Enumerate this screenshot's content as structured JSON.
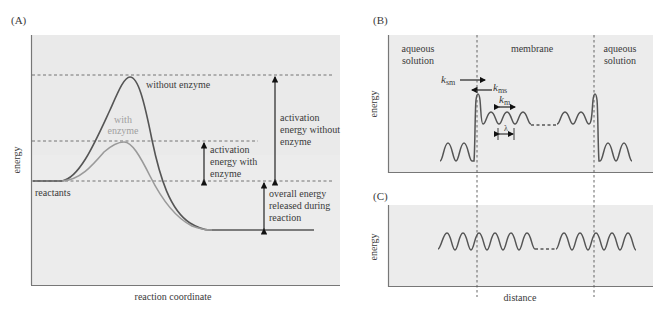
{
  "panelA": {
    "label": "(A)",
    "ylabel": "energy",
    "xlabel": "reaction coordinate",
    "curve_without": "without enzyme",
    "curve_with_1": "with",
    "curve_with_2": "enzyme",
    "reactants": "reactants",
    "act_without_1": "activation",
    "act_without_2": "energy without",
    "act_without_3": "enzyme",
    "act_with_1": "activation",
    "act_with_2": "energy with",
    "act_with_3": "enzyme",
    "overall_1": "overall energy",
    "overall_2": "released during",
    "overall_3": "reaction",
    "colors": {
      "without": "#555555",
      "with": "#9a9a9a",
      "bg": "#ececec"
    }
  },
  "panelB": {
    "label": "(B)",
    "ylabel": "energy",
    "left_region_1": "aqueous",
    "left_region_2": "solution",
    "middle_region": "membrane",
    "right_region_1": "aqueous",
    "right_region_2": "solution",
    "k_sm": "k",
    "k_sm_sub": "sm",
    "k_ms": "k",
    "k_ms_sub": "ms",
    "k_m": "k",
    "k_m_sub": "m",
    "lambda": "λ"
  },
  "panelC": {
    "label": "(C)",
    "ylabel": "energy",
    "xlabel": "distance"
  }
}
